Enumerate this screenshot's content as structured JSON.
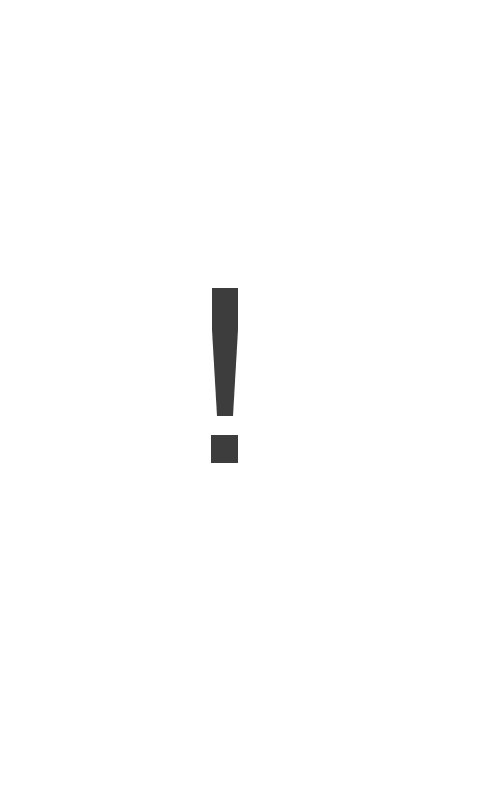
{
  "alert": {
    "icon": "exclamation-mark-icon",
    "glyph": "!",
    "color": "#3d3d3d"
  },
  "background": {
    "color": "#ffffff"
  }
}
